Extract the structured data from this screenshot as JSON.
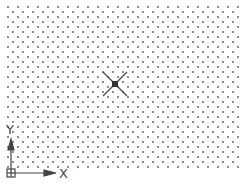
{
  "viewport": {
    "background": "#ffffff",
    "grid_dot_color": "#8a8a8a",
    "grid_spacing_px": 5
  },
  "crosshair": {
    "center_x": 115,
    "center_y": 84,
    "color": "#555555"
  },
  "ucs_icon": {
    "x_label": "X",
    "y_label": "Y",
    "color": "#444444"
  }
}
